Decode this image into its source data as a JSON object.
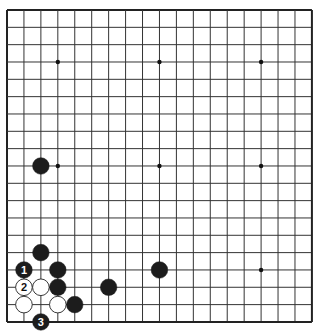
{
  "board": {
    "size": 19,
    "origin_x": 7,
    "origin_y": 10,
    "spacing_x": 16.94,
    "spacing_y": 17.33,
    "line_color": "#333333",
    "edge_color": "#222222",
    "background": "#ffffff",
    "star_points": [
      [
        4,
        4
      ],
      [
        10,
        4
      ],
      [
        16,
        4
      ],
      [
        4,
        10
      ],
      [
        10,
        10
      ],
      [
        16,
        10
      ],
      [
        4,
        16
      ],
      [
        10,
        16
      ],
      [
        16,
        16
      ]
    ]
  },
  "stones": [
    {
      "color": "black",
      "col": 3,
      "row": 10,
      "label": ""
    },
    {
      "color": "black",
      "col": 3,
      "row": 15,
      "label": ""
    },
    {
      "color": "black",
      "col": 2,
      "row": 16,
      "label": "1"
    },
    {
      "color": "black",
      "col": 4,
      "row": 16,
      "label": ""
    },
    {
      "color": "black",
      "col": 10,
      "row": 16,
      "label": ""
    },
    {
      "color": "white",
      "col": 2,
      "row": 17,
      "label": "2"
    },
    {
      "color": "white",
      "col": 3,
      "row": 17,
      "label": ""
    },
    {
      "color": "black",
      "col": 4,
      "row": 17,
      "label": ""
    },
    {
      "color": "black",
      "col": 7,
      "row": 17,
      "label": ""
    },
    {
      "color": "white",
      "col": 2,
      "row": 18,
      "label": ""
    },
    {
      "color": "white",
      "col": 4,
      "row": 18,
      "label": ""
    },
    {
      "color": "black",
      "col": 5,
      "row": 18,
      "label": ""
    },
    {
      "color": "black",
      "col": 3,
      "row": 19,
      "label": "3"
    }
  ],
  "colors": {
    "black_stone": "#1c1c1c",
    "white_stone": "#ffffff",
    "white_outline": "#222222",
    "label_on_black": "#ffffff",
    "label_on_white": "#111111"
  }
}
